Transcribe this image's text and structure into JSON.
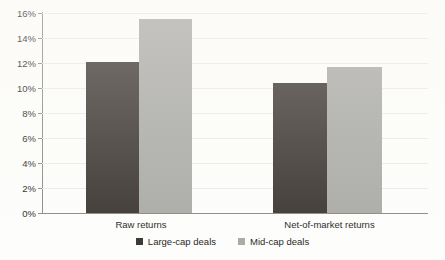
{
  "chart_data": {
    "type": "bar",
    "title": "",
    "subtitle": "",
    "xlabel": "",
    "ylabel": "",
    "categories": [
      "Raw returns",
      "Net-of-market returns"
    ],
    "series": [
      {
        "name": "Large-cap deals",
        "color": "#3b3531",
        "values": [
          12.1,
          10.4
        ]
      },
      {
        "name": "Mid-cap deals",
        "color": "#a9a9a6",
        "values": [
          15.5,
          11.7
        ]
      }
    ],
    "ylim": [
      0,
      16
    ],
    "ytick_step": 2,
    "ytick_labels": [
      "0%",
      "2%",
      "4%",
      "6%",
      "8%",
      "10%",
      "12%",
      "14%",
      "16%"
    ],
    "ytick_values": [
      0,
      2,
      4,
      6,
      8,
      10,
      12,
      14,
      16
    ],
    "value_suffix": "%",
    "grid": true,
    "grid_axis": "y",
    "legend_position": "bottom",
    "legend": [
      "Large-cap deals",
      "Mid-cap deals"
    ],
    "annotations": []
  },
  "axis": {
    "y_labels": [
      "16%",
      "14%",
      "12%",
      "10%",
      "8%",
      "6%",
      "4%",
      "2%",
      "0%"
    ]
  },
  "categories": {
    "first": "Raw returns",
    "second": "Net-of-market returns"
  },
  "legend": {
    "series_one": "Large-cap deals",
    "series_two": "Mid-cap deals"
  },
  "colors": {
    "large_cap": "#3b3531",
    "mid_cap": "#a9a9a6",
    "grid": "#eceae4",
    "axis": "#8c8883",
    "text": "#231f1c",
    "background": "#fdfdfb"
  }
}
